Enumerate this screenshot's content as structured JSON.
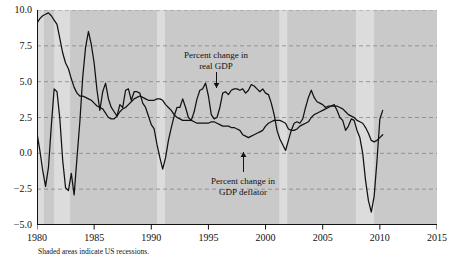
{
  "caption": "Shaded areas indicate US recessions.",
  "annotations": [
    {
      "name": "real-gdp",
      "line1": "Percent change in",
      "line2": "real GDP",
      "x": 216,
      "y": 50,
      "arrow": "down",
      "arrow_x": 216,
      "arrow_y0": 72,
      "arrow_y1": 88
    },
    {
      "name": "gdp-deflator",
      "line1": "Percent change in",
      "line2": "GDP deflator",
      "x": 243,
      "y": 176,
      "arrow": "up",
      "arrow_x": 243,
      "arrow_y0": 172,
      "arrow_y1": 152
    }
  ],
  "colors": {
    "plot_background": "#c9c9c9",
    "recession_band": "#dcdcdc",
    "line": "#111111",
    "gridline": "#7a7a7a",
    "axis": "#111111",
    "page_background": "#ffffff"
  },
  "chart_data": {
    "type": "line",
    "title": "",
    "subtitle": "",
    "xlabel": "",
    "ylabel": "",
    "xlim": [
      1980,
      2015
    ],
    "ylim": [
      -5.0,
      10.0
    ],
    "xticks": [
      1980,
      1985,
      1990,
      1995,
      2000,
      2005,
      2010,
      2015
    ],
    "yticks": [
      -5.0,
      -2.5,
      0.0,
      2.5,
      5.0,
      7.5,
      10.0
    ],
    "ytick_labels": [
      "-5.0",
      "-2.5",
      "0.0",
      "2.5",
      "5.0",
      "7.5",
      "10.0"
    ],
    "grid": true,
    "grid_style": "dashed",
    "grid_axis": "y",
    "legend": "annotations",
    "shaded_regions": {
      "label": "US recessions",
      "spans": [
        [
          1980.0,
          1980.6
        ],
        [
          1981.5,
          1982.9
        ],
        [
          1990.5,
          1991.2
        ],
        [
          2001.2,
          2001.9
        ],
        [
          2007.9,
          2009.5
        ]
      ]
    },
    "series": [
      {
        "name": "Percent change in real GDP",
        "x": [
          1980.0,
          1980.25,
          1980.5,
          1980.75,
          1981.0,
          1981.25,
          1981.5,
          1981.75,
          1982.0,
          1982.25,
          1982.5,
          1982.75,
          1983.0,
          1983.25,
          1983.5,
          1983.75,
          1984.0,
          1984.25,
          1984.5,
          1984.75,
          1985.0,
          1985.25,
          1985.5,
          1985.75,
          1986.0,
          1986.25,
          1986.5,
          1986.75,
          1987.0,
          1987.25,
          1987.5,
          1987.75,
          1988.0,
          1988.25,
          1988.5,
          1988.75,
          1989.0,
          1989.25,
          1989.5,
          1989.75,
          1990.0,
          1990.25,
          1990.5,
          1990.75,
          1991.0,
          1991.25,
          1991.5,
          1991.75,
          1992.0,
          1992.25,
          1992.5,
          1992.75,
          1993.0,
          1993.25,
          1993.5,
          1993.75,
          1994.0,
          1994.25,
          1994.5,
          1994.75,
          1995.0,
          1995.25,
          1995.5,
          1995.75,
          1996.0,
          1996.25,
          1996.5,
          1996.75,
          1997.0,
          1997.25,
          1997.5,
          1997.75,
          1998.0,
          1998.25,
          1998.5,
          1998.75,
          1999.0,
          1999.25,
          1999.5,
          1999.75,
          2000.0,
          2000.25,
          2000.5,
          2000.75,
          2001.0,
          2001.25,
          2001.5,
          2001.75,
          2002.0,
          2002.25,
          2002.5,
          2002.75,
          2003.0,
          2003.25,
          2003.5,
          2003.75,
          2004.0,
          2004.25,
          2004.5,
          2004.75,
          2005.0,
          2005.25,
          2005.5,
          2005.75,
          2006.0,
          2006.25,
          2006.5,
          2006.75,
          2007.0,
          2007.25,
          2007.5,
          2007.75,
          2008.0,
          2008.25,
          2008.5,
          2008.75,
          2009.0,
          2009.25,
          2009.5,
          2009.75,
          2010.0,
          2010.25
        ],
        "y": [
          1.4,
          0.2,
          -1.2,
          -2.3,
          -1.0,
          1.9,
          4.5,
          4.3,
          2.4,
          -0.5,
          -2.4,
          -2.6,
          -1.4,
          -2.9,
          -0.3,
          2.2,
          5.3,
          7.4,
          8.5,
          7.6,
          6.3,
          4.4,
          3.0,
          4.3,
          4.9,
          3.8,
          3.2,
          2.9,
          2.6,
          3.4,
          3.2,
          4.4,
          4.5,
          3.7,
          4.3,
          4.3,
          4.2,
          3.5,
          3.2,
          2.6,
          2.0,
          1.7,
          0.6,
          -0.3,
          -1.1,
          -0.3,
          0.9,
          1.8,
          2.6,
          3.2,
          3.2,
          3.8,
          3.2,
          2.5,
          2.3,
          2.9,
          3.8,
          4.4,
          4.5,
          4.9,
          4.0,
          2.7,
          2.4,
          2.5,
          3.2,
          4.2,
          4.3,
          4.1,
          4.4,
          4.5,
          4.5,
          4.4,
          4.5,
          4.2,
          4.4,
          4.8,
          4.7,
          4.5,
          4.3,
          4.5,
          4.2,
          4.1,
          3.5,
          2.7,
          1.6,
          1.0,
          0.6,
          0.2,
          0.9,
          1.6,
          2.1,
          2.2,
          2.1,
          2.4,
          3.2,
          3.9,
          4.4,
          3.9,
          3.6,
          3.5,
          3.4,
          3.2,
          3.3,
          3.3,
          3.4,
          3.0,
          2.5,
          2.3,
          1.6,
          1.9,
          2.4,
          2.3,
          1.6,
          1.1,
          0.0,
          -1.9,
          -3.3,
          -4.1,
          -3.0,
          -0.5,
          2.4,
          3.0
        ]
      },
      {
        "name": "Percent change in GDP deflator",
        "x": [
          1980.0,
          1980.25,
          1980.5,
          1980.75,
          1981.0,
          1981.25,
          1981.5,
          1981.75,
          1982.0,
          1982.25,
          1982.5,
          1982.75,
          1983.0,
          1983.25,
          1983.5,
          1983.75,
          1984.0,
          1984.25,
          1984.5,
          1984.75,
          1985.0,
          1985.25,
          1985.5,
          1985.75,
          1986.0,
          1986.25,
          1986.5,
          1986.75,
          1987.0,
          1987.25,
          1987.5,
          1987.75,
          1988.0,
          1988.25,
          1988.5,
          1988.75,
          1989.0,
          1989.25,
          1989.5,
          1989.75,
          1990.0,
          1990.25,
          1990.5,
          1990.75,
          1991.0,
          1991.25,
          1991.5,
          1991.75,
          1992.0,
          1992.25,
          1992.5,
          1992.75,
          1993.0,
          1993.25,
          1993.5,
          1993.75,
          1994.0,
          1994.25,
          1994.5,
          1994.75,
          1995.0,
          1995.25,
          1995.5,
          1995.75,
          1996.0,
          1996.25,
          1996.5,
          1996.75,
          1997.0,
          1997.25,
          1997.5,
          1997.75,
          1998.0,
          1998.25,
          1998.5,
          1998.75,
          1999.0,
          1999.25,
          1999.5,
          1999.75,
          2000.0,
          2000.25,
          2000.5,
          2000.75,
          2001.0,
          2001.25,
          2001.5,
          2001.75,
          2002.0,
          2002.25,
          2002.5,
          2002.75,
          2003.0,
          2003.25,
          2003.5,
          2003.75,
          2004.0,
          2004.25,
          2004.5,
          2004.75,
          2005.0,
          2005.25,
          2005.5,
          2005.75,
          2006.0,
          2006.25,
          2006.5,
          2006.75,
          2007.0,
          2007.25,
          2007.5,
          2007.75,
          2008.0,
          2008.25,
          2008.5,
          2008.75,
          2009.0,
          2009.25,
          2009.5,
          2009.75,
          2010.0,
          2010.25
        ],
        "y": [
          9.1,
          9.4,
          9.6,
          9.7,
          9.8,
          9.6,
          9.3,
          9.0,
          8.0,
          7.0,
          6.3,
          5.9,
          5.2,
          4.6,
          4.2,
          4.0,
          4.0,
          3.9,
          3.8,
          3.7,
          3.5,
          3.3,
          3.2,
          3.1,
          2.8,
          2.5,
          2.4,
          2.4,
          2.6,
          2.9,
          3.1,
          3.2,
          3.4,
          3.6,
          3.8,
          3.9,
          4.0,
          3.9,
          3.8,
          3.7,
          3.7,
          3.7,
          3.8,
          3.8,
          3.7,
          3.4,
          3.2,
          3.0,
          2.7,
          2.5,
          2.4,
          2.3,
          2.3,
          2.3,
          2.3,
          2.2,
          2.1,
          2.1,
          2.1,
          2.1,
          2.1,
          2.2,
          2.2,
          2.1,
          2.0,
          1.9,
          1.9,
          1.9,
          1.8,
          1.8,
          1.7,
          1.6,
          1.3,
          1.2,
          1.1,
          1.2,
          1.3,
          1.4,
          1.5,
          1.6,
          1.9,
          2.1,
          2.2,
          2.3,
          2.3,
          2.3,
          2.2,
          2.1,
          1.7,
          1.6,
          1.6,
          1.7,
          1.9,
          2.0,
          2.1,
          2.2,
          2.5,
          2.7,
          2.8,
          2.9,
          3.0,
          3.1,
          3.2,
          3.3,
          3.3,
          3.3,
          3.2,
          3.1,
          2.9,
          2.7,
          2.6,
          2.5,
          2.3,
          2.2,
          2.1,
          1.8,
          1.4,
          0.9,
          0.8,
          0.9,
          1.1,
          1.3
        ]
      }
    ]
  }
}
